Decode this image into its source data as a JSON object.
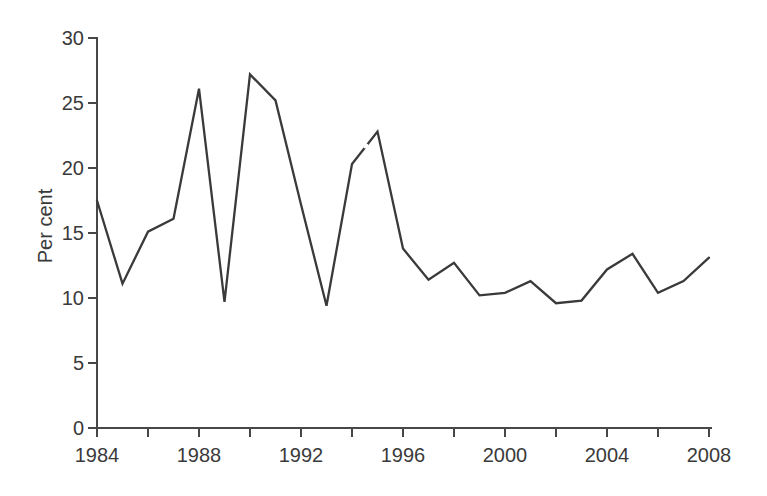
{
  "figure": {
    "background": "#ffffff",
    "line_color": "#3a3a3a",
    "axis_color": "#474747",
    "label_color": "#3a3a3a"
  },
  "chart_data": {
    "type": "line",
    "title": "",
    "xlabel": "",
    "ylabel": "Per cent",
    "x": [
      1984,
      1985,
      1986,
      1987,
      1988,
      1989,
      1990,
      1991,
      1992,
      1993,
      1994,
      1995,
      1996,
      1997,
      1998,
      1999,
      2000,
      2001,
      2002,
      2003,
      2004,
      2005,
      2006,
      2007,
      2008
    ],
    "values": [
      17.5,
      11.1,
      15.1,
      16.1,
      26.1,
      9.7,
      27.2,
      25.2,
      17.2,
      9.4,
      20.3,
      22.8,
      13.8,
      11.4,
      12.7,
      10.2,
      10.4,
      11.3,
      9.6,
      9.8,
      12.2,
      13.4,
      10.4,
      11.3,
      13.1
    ],
    "xlim": [
      1984,
      2008
    ],
    "ylim": [
      0,
      30
    ],
    "y_ticks": [
      0,
      5,
      10,
      15,
      20,
      25,
      30
    ],
    "x_tick_step": 2,
    "x_label_step": 4,
    "x_major_tick_labels": [
      "1984",
      "1988",
      "1992",
      "1996",
      "2000",
      "2004",
      "2008"
    ],
    "grid": false,
    "legend": "none"
  }
}
